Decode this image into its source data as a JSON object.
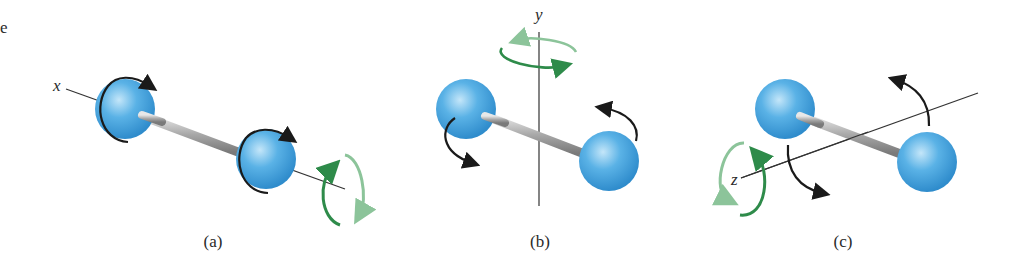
{
  "figure": {
    "corner_text": "e",
    "panels": [
      {
        "id": "a",
        "caption": "(a)",
        "axis_label": "x",
        "description": "Rotation about the x axis (along the bond)"
      },
      {
        "id": "b",
        "caption": "(b)",
        "axis_label": "y",
        "description": "Rotation about the vertical y axis"
      },
      {
        "id": "c",
        "caption": "(c)",
        "axis_label": "z",
        "description": "Rotation about the z axis"
      }
    ],
    "colors": {
      "atom": "#4aa6e0",
      "atom_highlight": "#bfe3f8",
      "atom_edge": "#2d86c4",
      "bond": "#b5b5b5",
      "arrow_dark": "#1a1a1a",
      "arrow_green": "#2e8b4a",
      "arrow_green_light": "#8cc49a",
      "axis_line": "#333333"
    }
  }
}
